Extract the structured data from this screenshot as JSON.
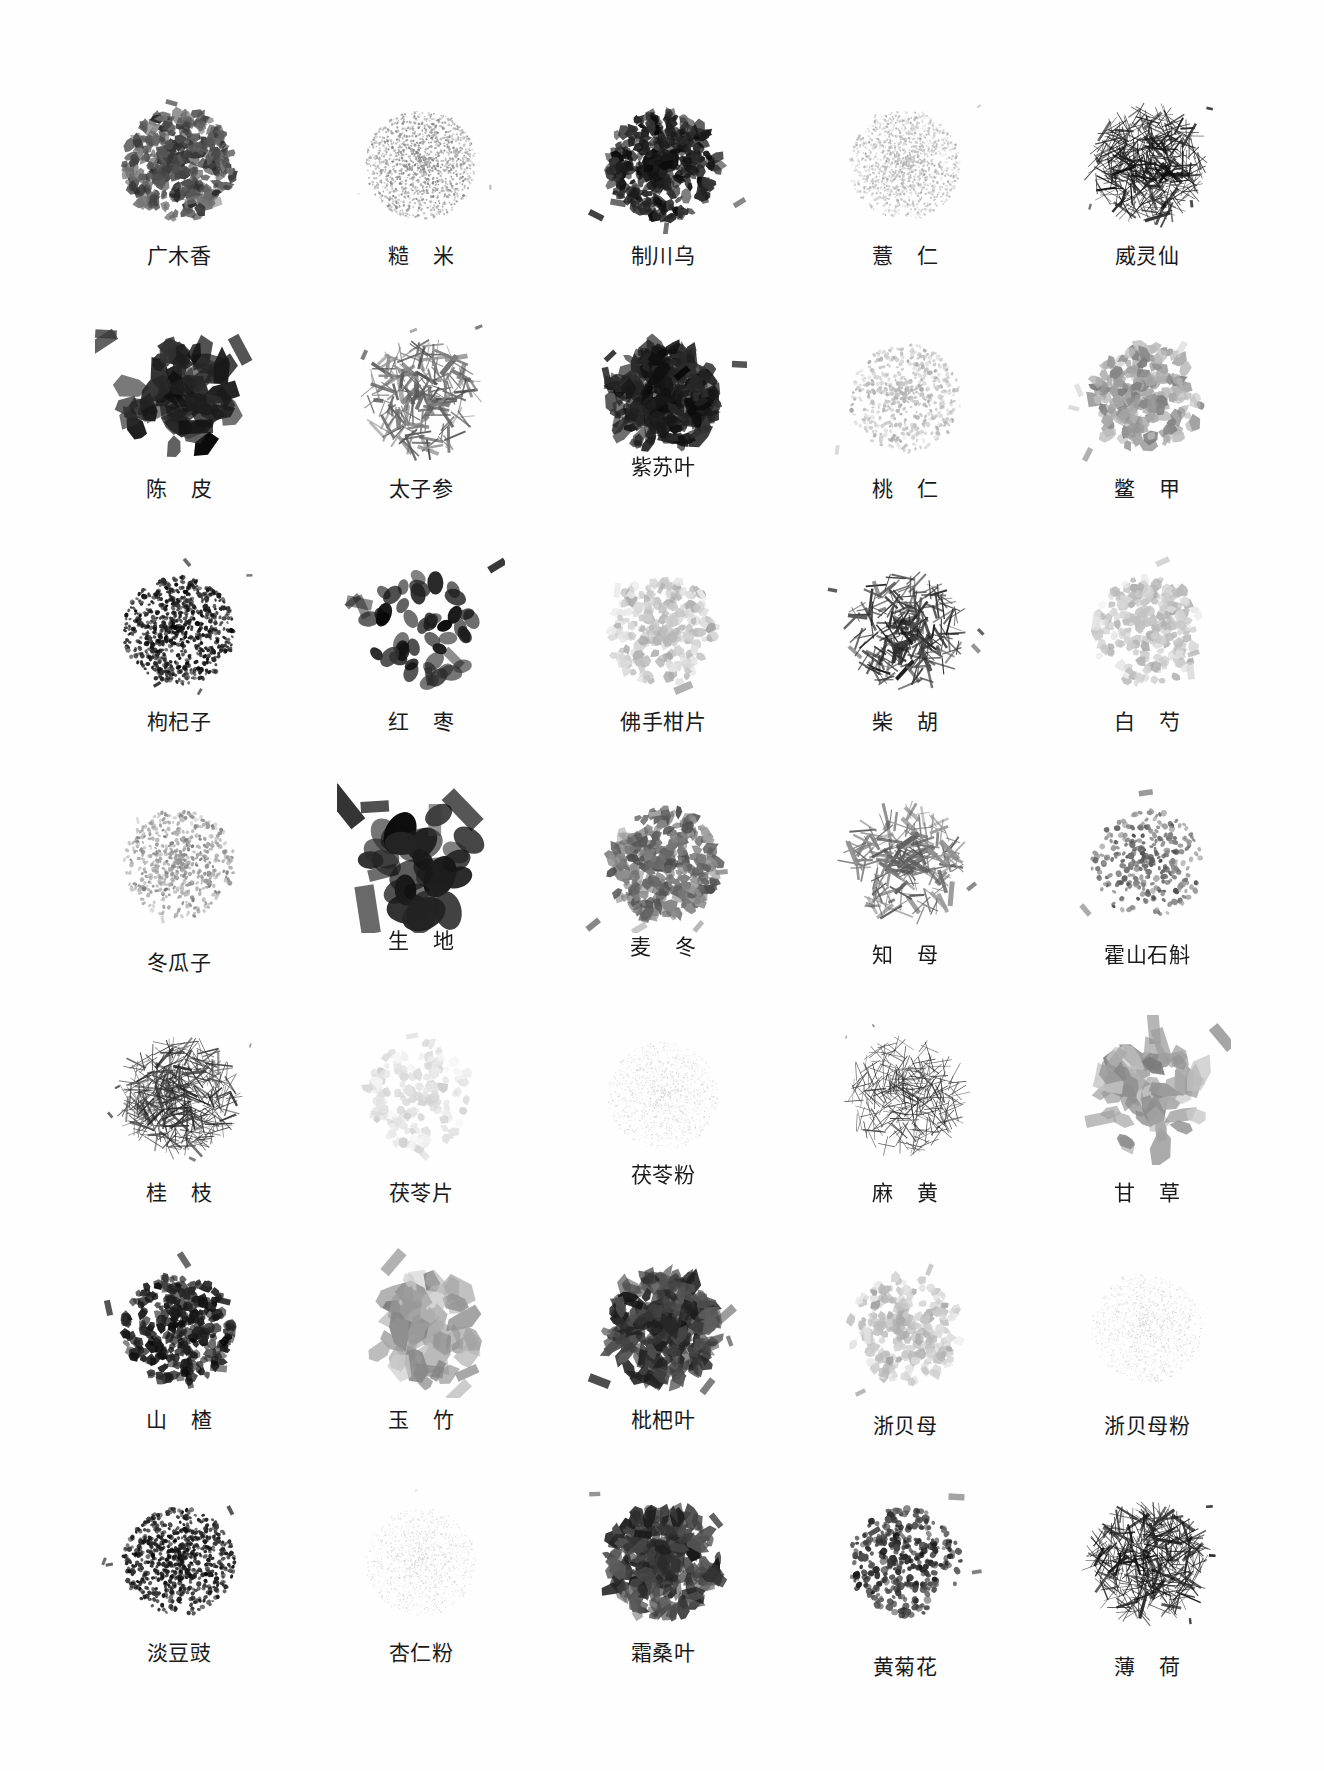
{
  "plate": {
    "background": "#ffffff",
    "ink": "#1a1a1a",
    "columns": 5,
    "rows": 7,
    "caption_style": "grayscale photographic specimen plate of Chinese herbal medicine (中药饮片) piles, each with a Chinese name caption"
  },
  "specimens": [
    {
      "label": "广木香",
      "spaced": false,
      "tone": "dark-medium",
      "texture": "chips",
      "label_dy": 0
    },
    {
      "label": "糙 米",
      "spaced": true,
      "tone": "light",
      "texture": "grain",
      "label_dy": 0
    },
    {
      "label": "制川乌",
      "spaced": false,
      "tone": "very-dark",
      "texture": "chips",
      "label_dy": 0
    },
    {
      "label": "薏 仁",
      "spaced": true,
      "tone": "very-light",
      "texture": "grain",
      "label_dy": 0
    },
    {
      "label": "威灵仙",
      "spaced": false,
      "tone": "very-dark",
      "texture": "sticks",
      "label_dy": 0
    },
    {
      "label": "陈 皮",
      "spaced": true,
      "tone": "very-dark",
      "texture": "slabs",
      "label_dy": 0
    },
    {
      "label": "太子参",
      "spaced": false,
      "tone": "medium",
      "texture": "roots",
      "label_dy": 0
    },
    {
      "label": "紫苏叶",
      "spaced": false,
      "tone": "very-dark",
      "texture": "leaves",
      "label_dy": -22
    },
    {
      "label": "桃 仁",
      "spaced": true,
      "tone": "very-light",
      "texture": "seeds",
      "label_dy": 0
    },
    {
      "label": "鳖 甲",
      "spaced": true,
      "tone": "light",
      "texture": "flakes",
      "label_dy": 0
    },
    {
      "label": "枸杞子",
      "spaced": false,
      "tone": "very-dark",
      "texture": "berries",
      "label_dy": 0
    },
    {
      "label": "红 枣",
      "spaced": true,
      "tone": "very-dark",
      "texture": "dates",
      "label_dy": 0
    },
    {
      "label": "佛手柑片",
      "spaced": false,
      "tone": "very-light",
      "texture": "slices",
      "label_dy": 0
    },
    {
      "label": "柴 胡",
      "spaced": true,
      "tone": "dark",
      "texture": "roots",
      "label_dy": 0
    },
    {
      "label": "白 芍",
      "spaced": true,
      "tone": "very-light",
      "texture": "slices",
      "label_dy": 0
    },
    {
      "label": "冬瓜子",
      "spaced": false,
      "tone": "light",
      "texture": "seeds",
      "label_dy": 8
    },
    {
      "label": "生 地",
      "spaced": true,
      "tone": "very-dark",
      "texture": "lumps",
      "label_dy": -14
    },
    {
      "label": "麦 冬",
      "spaced": true,
      "tone": "medium",
      "texture": "chips",
      "label_dy": -8
    },
    {
      "label": "知 母",
      "spaced": true,
      "tone": "medium",
      "texture": "roots",
      "label_dy": 0
    },
    {
      "label": "霍山石斛",
      "spaced": false,
      "tone": "medium",
      "texture": "coils",
      "label_dy": 0
    },
    {
      "label": "桂 枝",
      "spaced": true,
      "tone": "dark",
      "texture": "sticks",
      "label_dy": 6
    },
    {
      "label": "茯苓片",
      "spaced": false,
      "tone": "faint",
      "texture": "slices",
      "label_dy": 6
    },
    {
      "label": "茯苓粉",
      "spaced": false,
      "tone": "faint",
      "texture": "powder",
      "label_dy": -12
    },
    {
      "label": "麻 黄",
      "spaced": true,
      "tone": "dark",
      "texture": "needles",
      "label_dy": 6
    },
    {
      "label": "甘 草",
      "spaced": true,
      "tone": "light",
      "texture": "slabs",
      "label_dy": 6
    },
    {
      "label": "山 楂",
      "spaced": true,
      "tone": "very-dark",
      "texture": "slices",
      "label_dy": 0
    },
    {
      "label": "玉 竹",
      "spaced": true,
      "tone": "light",
      "texture": "slabs",
      "label_dy": 0
    },
    {
      "label": "枇杷叶",
      "spaced": false,
      "tone": "dark",
      "texture": "leaves",
      "label_dy": 0
    },
    {
      "label": "浙贝母",
      "spaced": false,
      "tone": "very-light",
      "texture": "slices",
      "label_dy": 6
    },
    {
      "label": "浙贝母粉",
      "spaced": false,
      "tone": "faint",
      "texture": "powder",
      "label_dy": 6
    },
    {
      "label": "淡豆豉",
      "spaced": false,
      "tone": "very-dark",
      "texture": "beans",
      "label_dy": 0
    },
    {
      "label": "杏仁粉",
      "spaced": false,
      "tone": "faint",
      "texture": "powder",
      "label_dy": 0
    },
    {
      "label": "霜桑叶",
      "spaced": false,
      "tone": "dark",
      "texture": "leaves",
      "label_dy": 0
    },
    {
      "label": "黄菊花",
      "spaced": false,
      "tone": "dark",
      "texture": "flowers",
      "label_dy": 14
    },
    {
      "label": "薄 荷",
      "spaced": true,
      "tone": "very-dark",
      "texture": "sticks",
      "label_dy": 14
    }
  ]
}
